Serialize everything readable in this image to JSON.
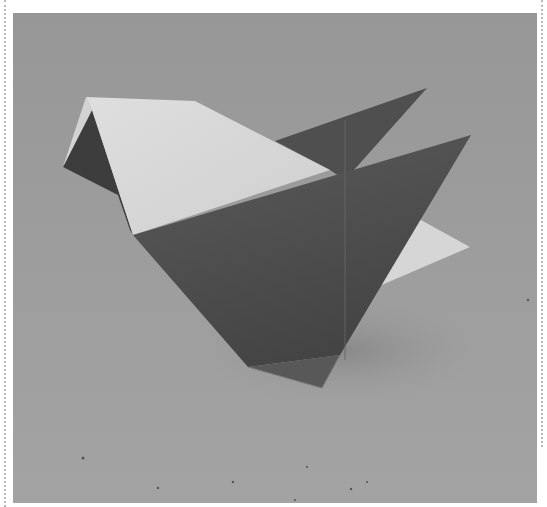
{
  "image": {
    "alt": "Origami paper bird (chick) in grey tones on a grey cardboard background",
    "subject": "origami bird",
    "colors": {
      "background": "#9c9c9c",
      "paper_light": "#d9d9d9",
      "paper_dark": "#555555",
      "paper_mid": "#4b4b4b",
      "shadow": "#3a3a3a",
      "frame": "#ffffff"
    }
  }
}
